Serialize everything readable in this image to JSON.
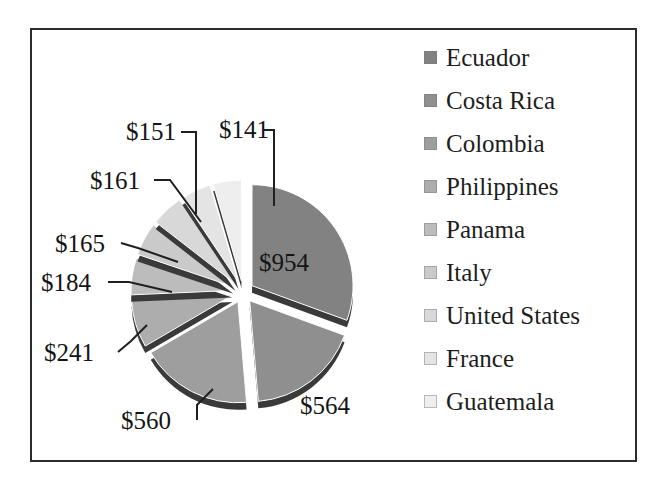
{
  "chart_data": {
    "type": "pie",
    "title": "",
    "exploded": true,
    "three_d": true,
    "categories": [
      "Ecuador",
      "Costa Rica",
      "Colombia",
      "Philippines",
      "Panama",
      "Italy",
      "United States",
      "France",
      "Guatemala"
    ],
    "values": [
      954,
      564,
      560,
      241,
      184,
      165,
      161,
      151,
      141
    ],
    "value_labels": [
      "$954",
      "$564",
      "$560",
      "$241",
      "$184",
      "$165",
      "$161",
      "$151",
      "$141"
    ],
    "currency_prefix": "$",
    "total": 3021,
    "legend_position": "right",
    "grid": false,
    "slice_colors": [
      "#828282",
      "#8f8f8f",
      "#9e9e9e",
      "#adadad",
      "#bcbcbc",
      "#cacaca",
      "#d8d8d8",
      "#e4e4e4",
      "#eeeeee"
    ],
    "edge_color": "#3a3a3a",
    "frame_color": "#2c2c2c",
    "background": "#ffffff"
  },
  "legend": {
    "items": [
      {
        "label": "Ecuador",
        "color": "#828282"
      },
      {
        "label": "Costa Rica",
        "color": "#8f8f8f"
      },
      {
        "label": "Colombia",
        "color": "#9e9e9e"
      },
      {
        "label": "Philippines",
        "color": "#adadad"
      },
      {
        "label": "Panama",
        "color": "#bcbcbc"
      },
      {
        "label": "Italy",
        "color": "#cacaca"
      },
      {
        "label": "United States",
        "color": "#d8d8d8"
      },
      {
        "label": "France",
        "color": "#e4e4e4"
      },
      {
        "label": "Guatemala",
        "color": "#eeeeee"
      }
    ]
  },
  "labels": {
    "v954": "$954",
    "v564": "$564",
    "v560": "$560",
    "v241": "$241",
    "v184": "$184",
    "v165": "$165",
    "v161": "$161",
    "v151": "$151",
    "v141": "$141"
  }
}
